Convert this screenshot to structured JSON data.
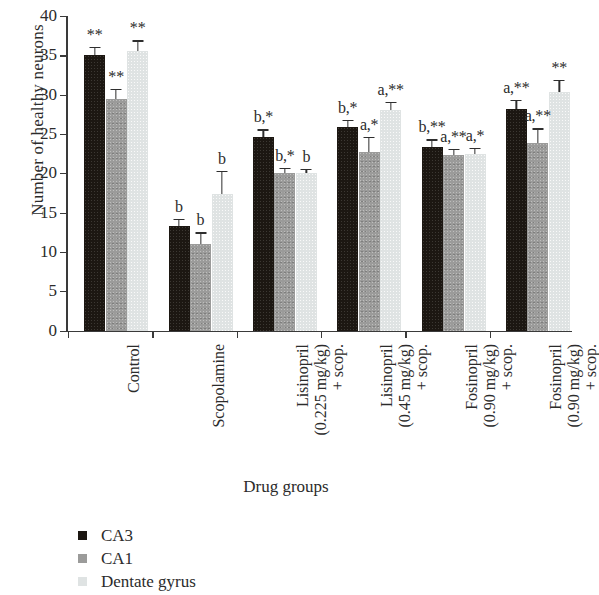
{
  "chart_data": {
    "type": "bar",
    "title": "",
    "xlabel": "Drug groups",
    "ylabel": "Number of healthy neurons",
    "ylim": [
      0,
      40
    ],
    "yticks": [
      0,
      5,
      10,
      15,
      20,
      25,
      30,
      35,
      40
    ],
    "grid": false,
    "legend_position": "bottom-left",
    "categories": [
      "Control",
      "Scopolamine",
      "Lisinopril (0.225 mg/kg) + scop.",
      "Lisinopril (0.45 mg/kg) + scop.",
      "Fosinopril (0.90 mg/kg) + scop.",
      "Fosinopril (0.90 mg/kg) + scop."
    ],
    "category_lines": [
      [
        "Control"
      ],
      [
        "Scopolamine"
      ],
      [
        "Lisinopril",
        "(0.225 mg/kg)",
        "+ scop."
      ],
      [
        "Lisinopril",
        "(0.45 mg/kg)",
        "+ scop."
      ],
      [
        "Fosinopril",
        "(0.90 mg/kg)",
        "+ scop."
      ],
      [
        "Fosinopril",
        "(0.90 mg/kg)",
        "+ scop."
      ]
    ],
    "series": [
      {
        "name": "CA3",
        "color": "#1c1712",
        "values": [
          35.0,
          13.3,
          24.6,
          25.9,
          23.4,
          28.2
        ],
        "errors": [
          1.1,
          0.9,
          1.0,
          0.9,
          0.9,
          1.1
        ],
        "annotations": [
          "**",
          "b",
          "b,*",
          "b,*",
          "b,**",
          "a,**"
        ]
      },
      {
        "name": "CA1",
        "color": "#9b9b9a",
        "values": [
          29.5,
          11.0,
          20.0,
          22.7,
          22.3,
          23.9
        ],
        "errors": [
          1.2,
          1.5,
          0.7,
          1.9,
          0.8,
          1.8
        ],
        "annotations": [
          "**",
          "b",
          "b,*",
          "a,*",
          "a,**",
          "a,**"
        ]
      },
      {
        "name": "Dentate gyrus",
        "color": "#dfe3e3",
        "values": [
          35.5,
          17.3,
          20.0,
          28.0,
          22.4,
          30.3
        ],
        "errors": [
          1.4,
          3.0,
          0.6,
          1.1,
          0.8,
          1.6
        ],
        "annotations": [
          "**",
          "b",
          "b",
          "a,**",
          "a,*",
          "**"
        ]
      }
    ]
  },
  "legend": {
    "items": [
      {
        "label": "CA3",
        "color": "#1c1712"
      },
      {
        "label": "CA1",
        "color": "#9b9b9a"
      },
      {
        "label": "Dentate gyrus",
        "color": "#dfe3e3"
      }
    ]
  },
  "axis": {
    "y_title": "Number of healthy neurons",
    "x_title": "Drug groups"
  }
}
